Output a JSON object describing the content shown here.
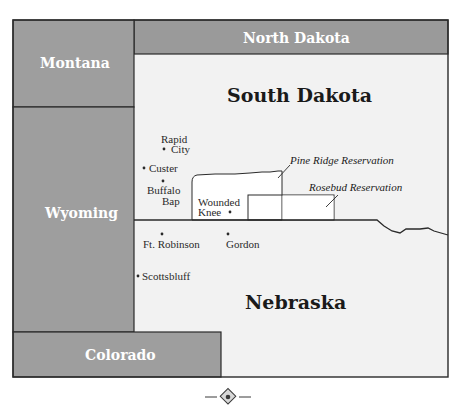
{
  "map": {
    "colors": {
      "gray_state": "#9e9e9e",
      "gray_state_dark": "#8f8f8f",
      "main_bg": "#f2f2f2",
      "reservation_fill": "#ffffff",
      "border": "#2a2a2a"
    },
    "states": {
      "montana": "Montana",
      "north_dakota": "North Dakota",
      "wyoming": "Wyoming",
      "colorado": "Colorado",
      "south_dakota": "South Dakota",
      "nebraska": "Nebraska"
    },
    "cities": {
      "rapid_city_line1": "Rapid",
      "rapid_city_line2": "City",
      "custer": "Custer",
      "buffalo_gap_line1": "Buffalo",
      "buffalo_gap_line2": "Bap",
      "wounded_knee_line1": "Wounded",
      "wounded_knee_line2": "Knee",
      "ft_robinson": "Ft. Robinson",
      "gordon": "Gordon",
      "scottsbluff": "Scottsbluff"
    },
    "reservations": {
      "pine_ridge": "Pine Ridge Reservation",
      "rosebud": "Rosebud Reservation"
    },
    "ornament": "diamond-ornament"
  }
}
